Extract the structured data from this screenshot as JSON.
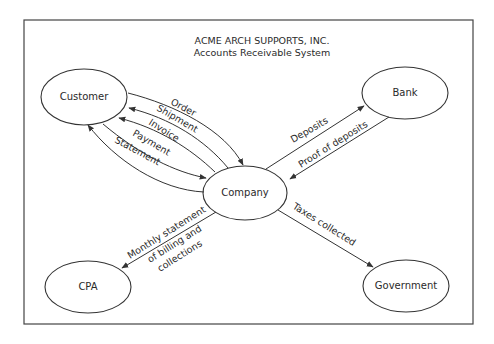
{
  "diagram": {
    "title": "ACME ARCH SUPPORTS, INC.",
    "subtitle": "Accounts Receivable System",
    "nodes": {
      "customer": "Customer",
      "bank": "Bank",
      "company": "Company",
      "cpa": "CPA",
      "government": "Government"
    },
    "flows": {
      "order": "Order",
      "shipment": "Shipment",
      "invoice": "Invoice",
      "payment": "Payment",
      "statement": "Statement",
      "deposits": "Deposits",
      "proof_of_deposits": "Proof of deposits",
      "monthly_statement_1": "Monthly statement",
      "monthly_statement_2": "of billing and",
      "monthly_statement_3": "collections",
      "taxes_collected": "Taxes collected"
    },
    "colors": {
      "line": "#333333",
      "background": "#ffffff"
    }
  }
}
